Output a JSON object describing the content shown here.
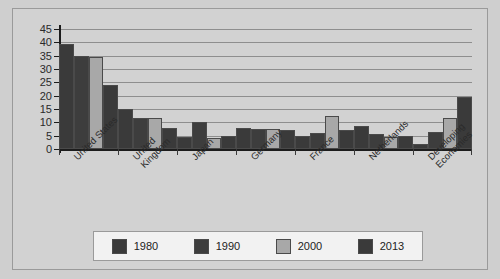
{
  "chart_data": {
    "type": "bar",
    "title": "",
    "xlabel": "",
    "ylabel": "",
    "ylim": [
      0,
      45
    ],
    "yticks": [
      0,
      5,
      10,
      15,
      20,
      25,
      30,
      35,
      40,
      45
    ],
    "grid": true,
    "legend_position": "bottom",
    "categories": [
      "United States",
      "United\nKingdom",
      "Japan",
      "Germany",
      "France",
      "Netherlands",
      "Developing\nEconomies"
    ],
    "series": [
      {
        "name": "1980",
        "color": "#3a3a3a",
        "values": [
          39.5,
          15.0,
          4.5,
          8.0,
          5.0,
          8.5,
          2.0
        ]
      },
      {
        "name": "1990",
        "color": "#3d3d3d",
        "values": [
          35.0,
          11.5,
          10.0,
          7.5,
          6.0,
          5.5,
          6.5
        ]
      },
      {
        "name": "2000",
        "color": "#a8a8a8",
        "values": [
          34.5,
          11.5,
          4.0,
          7.5,
          12.5,
          4.5,
          11.5
        ]
      },
      {
        "name": "2013",
        "color": "#3a3a3a",
        "values": [
          24.0,
          8.0,
          5.0,
          7.0,
          7.0,
          5.0,
          19.5
        ]
      }
    ]
  },
  "legend": {
    "items": [
      {
        "label": "1980",
        "color": "#3a3a3a"
      },
      {
        "label": "1990",
        "color": "#3d3d3d"
      },
      {
        "label": "2000",
        "color": "#a8a8a8"
      },
      {
        "label": "2013",
        "color": "#3a3a3a"
      }
    ]
  },
  "colors": {
    "background": "#cfcfcf",
    "panel": "#d2d2d2",
    "grid": "#8e8e8e",
    "axis": "#1c1c1c",
    "legend_background": "#f2f2f2"
  }
}
